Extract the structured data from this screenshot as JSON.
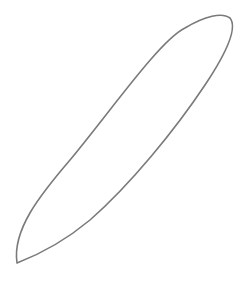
{
  "canvas": {
    "width": 245,
    "height": 281,
    "background": "#ffffff"
  },
  "shape": {
    "type": "closed-curve",
    "description": "elongated leaf/lens outline tilted diagonally",
    "stroke": "#7a7a7a",
    "stroke_width": 1.6,
    "fill": "none",
    "path": "M 17 263 C 12 230, 40 195, 70 160 C 110 112, 160 40, 185 28 C 205 16, 222 12, 230 18 C 238 28, 225 55, 205 85 C 175 130, 130 185, 90 220 C 60 245, 30 258, 17 263 Z"
  }
}
